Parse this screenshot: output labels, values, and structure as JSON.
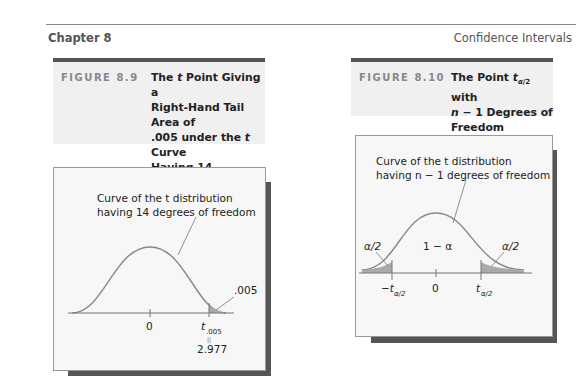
{
  "header": {
    "chapter": "Chapter 8",
    "section": "Confidence Intervals"
  },
  "figures": [
    {
      "label": "FIGURE 8.9",
      "title_lines": [
        "The t Point Giving a",
        "Right-Hand Tail Area of",
        ".005 under the t Curve",
        "Having 14 Degrees of",
        "Freedom: t.005 = 2.977"
      ],
      "curve_label_1": "Curve of the t distribution",
      "curve_label_2": "having 14 degrees of freedom",
      "tail_area": ".005",
      "tick_zero": "0",
      "tick_t": "t",
      "tick_t_sub": ".005",
      "equals": "||",
      "tick_value": "2.977"
    },
    {
      "label": "FIGURE 8.10",
      "title_lines": [
        "The Point tα/2 with",
        "n − 1 Degrees of",
        "Freedom"
      ],
      "curve_label_1": "Curve of the t distribution",
      "curve_label_2": "having n − 1 degrees of freedom",
      "left_tail": "α/2",
      "center": "1 − α",
      "right_tail": "α/2",
      "tick_neg": "−t",
      "tick_zero": "0",
      "tick_pos": "t",
      "sub": "α/2"
    }
  ]
}
